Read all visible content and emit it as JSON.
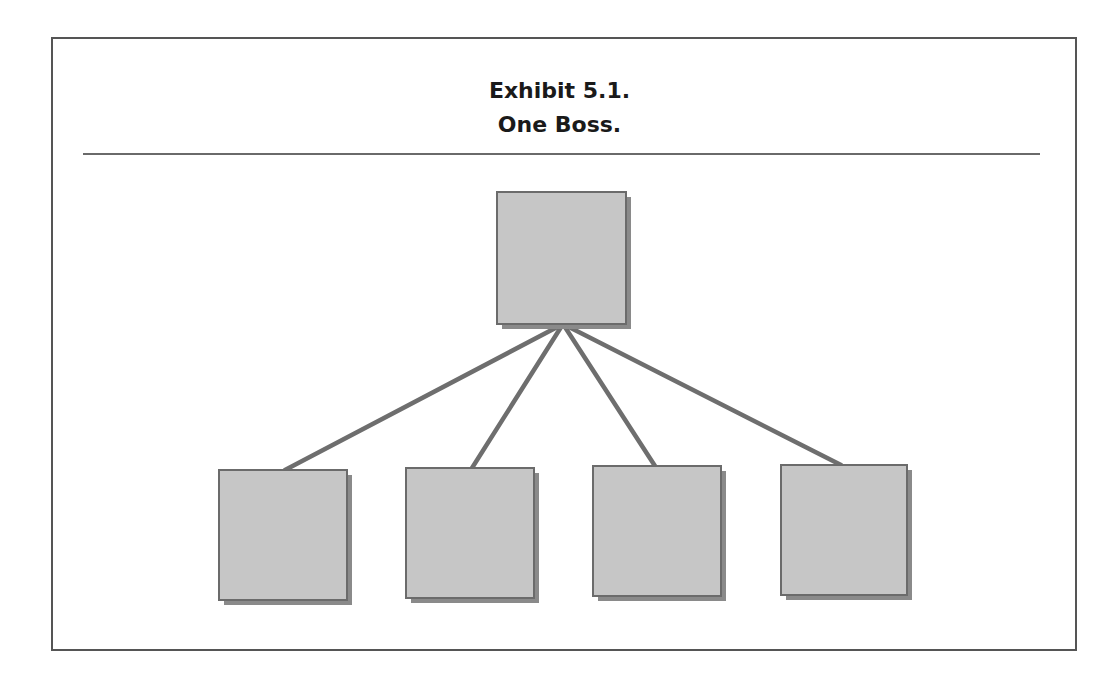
{
  "exhibit": {
    "title_line1": "Exhibit 5.1.",
    "title_line2": "One Boss."
  },
  "diagram": {
    "type": "org-chart",
    "colors": {
      "box_fill": "#c6c6c6",
      "box_border": "#6b6b6b",
      "box_shadow": "#8a8a8a",
      "connector": "#6e6e6e",
      "frame_border": "#555555"
    },
    "nodes": [
      {
        "id": "boss",
        "label": "",
        "x": 497,
        "y": 192,
        "w": 129,
        "h": 132
      },
      {
        "id": "subordinate-1",
        "label": "",
        "x": 219,
        "y": 470,
        "w": 128,
        "h": 130
      },
      {
        "id": "subordinate-2",
        "label": "",
        "x": 406,
        "y": 468,
        "w": 128,
        "h": 130
      },
      {
        "id": "subordinate-3",
        "label": "",
        "x": 593,
        "y": 466,
        "w": 128,
        "h": 130
      },
      {
        "id": "subordinate-4",
        "label": "",
        "x": 781,
        "y": 465,
        "w": 126,
        "h": 130
      }
    ],
    "edges": [
      {
        "from": "boss",
        "to": "subordinate-1",
        "x1": 563,
        "y1": 324,
        "x2": 285,
        "y2": 470
      },
      {
        "from": "boss",
        "to": "subordinate-2",
        "x1": 563,
        "y1": 324,
        "x2": 472,
        "y2": 468
      },
      {
        "from": "boss",
        "to": "subordinate-3",
        "x1": 563,
        "y1": 324,
        "x2": 655,
        "y2": 466
      },
      {
        "from": "boss",
        "to": "subordinate-4",
        "x1": 563,
        "y1": 324,
        "x2": 841,
        "y2": 465
      }
    ]
  }
}
